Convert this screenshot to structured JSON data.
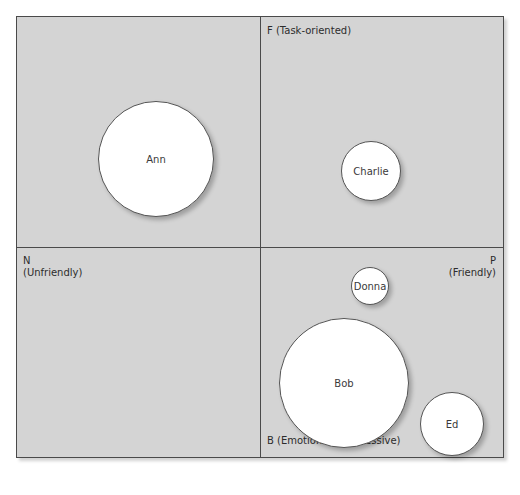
{
  "diagram": {
    "axes": {
      "top": "F (Task-oriented)",
      "left_line1": "N",
      "left_line2": "(Unfriendly)",
      "right_line1": "P",
      "right_line2": "(Friendly)",
      "bottom": "B (Emotionally expressive)"
    },
    "people": [
      {
        "name": "Ann",
        "quadrant": "upper-left",
        "size": "large"
      },
      {
        "name": "Charlie",
        "quadrant": "upper-right",
        "size": "small"
      },
      {
        "name": "Donna",
        "quadrant": "lower-right",
        "size": "very small"
      },
      {
        "name": "Bob",
        "quadrant": "lower-right",
        "size": "large"
      },
      {
        "name": "Ed",
        "quadrant": "lower-right",
        "size": "small"
      }
    ],
    "colors": {
      "background": "#d4d4d4",
      "lines": "#4a4a4a",
      "circle_fill": "#ffffff"
    }
  }
}
